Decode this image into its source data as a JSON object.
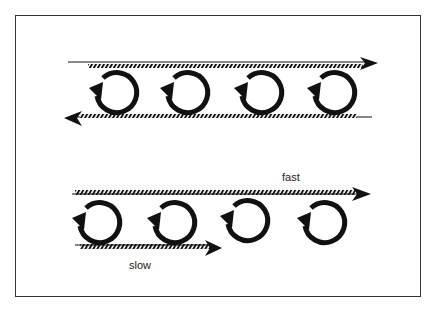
{
  "diagram": {
    "top_panel": {
      "upper_flow_direction": "right",
      "lower_flow_direction": "left",
      "vortex_count": 4,
      "vortex_rotation": "counterclockwise"
    },
    "bottom_panel": {
      "upper_flow": {
        "label": "fast",
        "direction": "right"
      },
      "lower_flow": {
        "label": "slow",
        "direction": "right"
      },
      "vortex_count": 4,
      "vortex_rotation": "counterclockwise"
    },
    "colors": {
      "ink": "#111111",
      "background": "#ffffff"
    }
  }
}
